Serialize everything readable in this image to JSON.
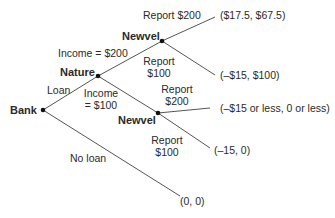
{
  "nodes": {
    "bank": {
      "label": "Bank",
      "x": 43,
      "y": 110
    },
    "nature": {
      "label": "Nature",
      "x": 98,
      "y": 76
    },
    "newvel_top": {
      "label": "Newvel",
      "x": 162,
      "y": 41
    },
    "newvel_bottom": {
      "label": "Newvel",
      "x": 158,
      "y": 113
    }
  },
  "edges": {
    "loan": {
      "label": "Loan"
    },
    "no_loan": {
      "label": "No loan"
    },
    "income_200": {
      "label": "Income = $200"
    },
    "income_100": {
      "line1": "Income",
      "line2": "= $100"
    },
    "top_report_200": {
      "label": "Report $200"
    },
    "top_report_100": {
      "line1": "Report",
      "line2": "$100"
    },
    "bottom_report_200": {
      "line1": "Report",
      "line2": "$200"
    },
    "bottom_report_100": {
      "line1": "Report",
      "line2": "$100"
    }
  },
  "payoffs": {
    "p1": "($17.5, $67.5)",
    "p2": "(–$15, $100)",
    "p3": "(–$15 or less, 0 or less)",
    "p4": "(–15, 0)",
    "p5": "(0, 0)"
  },
  "colors": {
    "line": "#555555",
    "node": "#111111",
    "text": "#2a2a2a"
  }
}
